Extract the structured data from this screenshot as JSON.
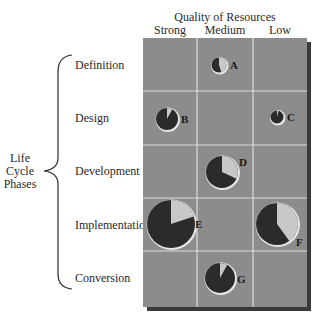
{
  "chart_data": {
    "type": "bubble-pie-matrix",
    "title": "",
    "x_axis": {
      "label": "Quality of Resources",
      "categories": [
        "Strong",
        "Medium",
        "Low"
      ]
    },
    "y_axis": {
      "label": "Life Cycle Phases",
      "label_lines": [
        "Life",
        "Cycle",
        "Phases"
      ],
      "categories": [
        "Definition",
        "Design",
        "Development",
        "Implementation",
        "Conversion"
      ]
    },
    "colors": {
      "cell_background": "#8c8c8c",
      "grid_line": "#d9d9d9",
      "shadow": "#3a3a3a",
      "pie_dark": "#2b2b2b",
      "pie_light": "#c8c8c8",
      "pie_rim": "#e6e6e6"
    },
    "points": [
      {
        "label": "A",
        "phase": "Definition",
        "quality": "Medium",
        "relative_size": 7.5,
        "light_fraction": 0.45
      },
      {
        "label": "B",
        "phase": "Design",
        "quality": "Strong",
        "relative_size": 11,
        "light_fraction": 0.08
      },
      {
        "label": "C",
        "phase": "Design",
        "quality": "Low",
        "relative_size": 6.5,
        "light_fraction": 0.04
      },
      {
        "label": "D",
        "phase": "Development",
        "quality": "Medium",
        "relative_size": 16,
        "light_fraction": 0.32
      },
      {
        "label": "E",
        "phase": "Implementation",
        "quality": "Strong",
        "relative_size": 24,
        "light_fraction": 0.2
      },
      {
        "label": "F",
        "phase": "Implementation",
        "quality": "Low",
        "relative_size": 21,
        "light_fraction": 0.4
      },
      {
        "label": "G",
        "phase": "Conversion",
        "quality": "Medium",
        "relative_size": 15,
        "light_fraction": 0.08
      }
    ],
    "layout": {
      "grid_left": 143,
      "grid_top": 38,
      "col_edges": [
        143,
        197,
        253,
        307
      ],
      "row_edges": [
        38,
        91,
        145,
        198,
        251,
        307
      ],
      "pie_positions": {
        "A": {
          "cx": 219,
          "cy": 65,
          "r": 7.5,
          "label_dx": 11,
          "label_dy": 4
        },
        "B": {
          "cx": 167,
          "cy": 119,
          "r": 11,
          "label_dx": 14,
          "label_dy": 4
        },
        "C": {
          "cx": 277,
          "cy": 117,
          "r": 6.5,
          "label_dx": 10,
          "label_dy": 4
        },
        "D": {
          "cx": 222,
          "cy": 172,
          "r": 16,
          "label_dx": 17,
          "label_dy": -6
        },
        "E": {
          "cx": 171,
          "cy": 224,
          "r": 24,
          "label_dx": 24,
          "label_dy": 4
        },
        "F": {
          "cx": 277,
          "cy": 224,
          "r": 21,
          "label_dx": 19,
          "label_dy": 22
        },
        "G": {
          "cx": 220,
          "cy": 278,
          "r": 15,
          "label_dx": 17,
          "label_dy": 5
        }
      }
    }
  },
  "header": {
    "title": "Quality of Resources",
    "columns": [
      "Strong",
      "Medium",
      "Low"
    ]
  },
  "side": {
    "group_label": [
      "Life",
      "Cycle",
      "Phases"
    ],
    "rows": [
      "Definition",
      "Design",
      "Development",
      "Implementation",
      "Conversion"
    ]
  }
}
